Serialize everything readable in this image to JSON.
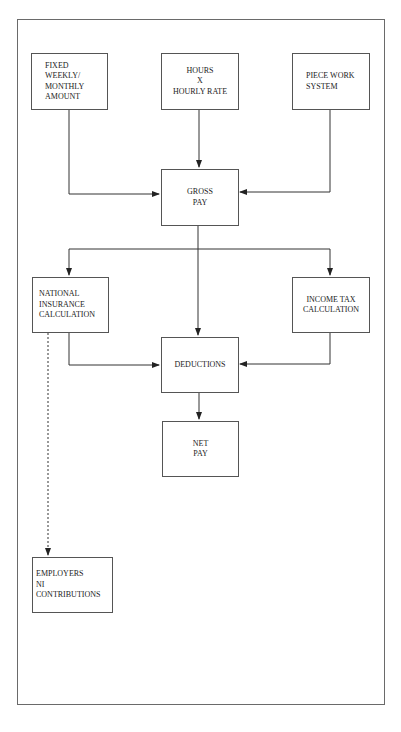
{
  "diagram": {
    "title": "",
    "nodes": {
      "fixed": {
        "lines": [
          "FIXED",
          "WEEKLY/",
          "MONTHLY",
          "AMOUNT"
        ]
      },
      "hours": {
        "lines": [
          "HOURS",
          "X",
          "HOURLY RATE"
        ]
      },
      "piece": {
        "lines": [
          "PIECE WORK",
          "SYSTEM"
        ]
      },
      "gross": {
        "lines": [
          "GROSS",
          "PAY"
        ]
      },
      "ni": {
        "lines": [
          "NATIONAL",
          "INSURANCE",
          "CALCULATION"
        ]
      },
      "tax": {
        "lines": [
          "INCOME TAX",
          "CALCULATION"
        ]
      },
      "deductions": {
        "lines": [
          "DEDUCTIONS"
        ]
      },
      "net": {
        "lines": [
          "NET",
          "PAY"
        ]
      },
      "employers": {
        "lines": [
          "EMPLOYERS",
          "NI",
          "CONTRIBUTIONS"
        ]
      }
    },
    "edges": [
      {
        "from": "fixed",
        "to": "gross",
        "style": "solid"
      },
      {
        "from": "hours",
        "to": "gross",
        "style": "solid"
      },
      {
        "from": "piece",
        "to": "gross",
        "style": "solid"
      },
      {
        "from": "gross",
        "to": "ni",
        "style": "solid"
      },
      {
        "from": "gross",
        "to": "deductions",
        "style": "solid"
      },
      {
        "from": "gross",
        "to": "tax",
        "style": "solid"
      },
      {
        "from": "ni",
        "to": "deductions",
        "style": "solid"
      },
      {
        "from": "tax",
        "to": "deductions",
        "style": "solid"
      },
      {
        "from": "deductions",
        "to": "net",
        "style": "solid"
      },
      {
        "from": "ni",
        "to": "employers",
        "style": "dotted"
      }
    ],
    "colors": {
      "line": "#333333",
      "frame": "#6a6a6a",
      "background": "#ffffff"
    }
  }
}
